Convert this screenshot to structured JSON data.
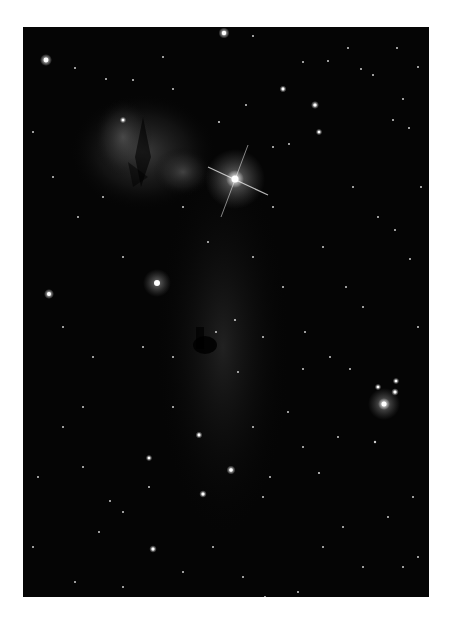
{
  "image": {
    "subject": "Horsehead and Flame Nebula star field",
    "style": "grayscale astrophotograph",
    "frame": {
      "left": 23,
      "top": 27,
      "width": 406,
      "height": 570
    },
    "background_color": "#050505",
    "page_background": "#ffffff"
  },
  "features": {
    "flame_nebula": {
      "cx": 125,
      "cy": 120,
      "r": 70
    },
    "bright_star_alnitak": {
      "cx": 212,
      "cy": 152
    },
    "horsehead_dark_nebula": {
      "cx": 185,
      "cy": 320
    },
    "nebula_star": {
      "cx": 134,
      "cy": 256
    },
    "bright_star_lower_right": {
      "cx": 361,
      "cy": 377
    }
  },
  "stars": [
    [
      23,
      33,
      2.4
    ],
    [
      201,
      6,
      2.2
    ],
    [
      52,
      41,
      1
    ],
    [
      83,
      52,
      1
    ],
    [
      110,
      53,
      1
    ],
    [
      230,
      9,
      1
    ],
    [
      280,
      35,
      1
    ],
    [
      305,
      34,
      1
    ],
    [
      325,
      21,
      1
    ],
    [
      350,
      48,
      1
    ],
    [
      374,
      21,
      1
    ],
    [
      395,
      40,
      1
    ],
    [
      150,
      62,
      1
    ],
    [
      260,
      62,
      1.4
    ],
    [
      292,
      78,
      1.6
    ],
    [
      296,
      105,
      1.3
    ],
    [
      223,
      78,
      1
    ],
    [
      338,
      42,
      1
    ],
    [
      380,
      72,
      1
    ],
    [
      10,
      105,
      1
    ],
    [
      100,
      93,
      1.3
    ],
    [
      196,
      95,
      1.1
    ],
    [
      370,
      93,
      1
    ],
    [
      386,
      101,
      1
    ],
    [
      266,
      117,
      1
    ],
    [
      330,
      160,
      1
    ],
    [
      398,
      160,
      1
    ],
    [
      250,
      180,
      1
    ],
    [
      355,
      190,
      1
    ],
    [
      372,
      203,
      1
    ],
    [
      387,
      232,
      1
    ],
    [
      300,
      220,
      1
    ],
    [
      323,
      260,
      1
    ],
    [
      340,
      280,
      1
    ],
    [
      282,
      305,
      1
    ],
    [
      307,
      330,
      1
    ],
    [
      327,
      342,
      1
    ],
    [
      355,
      360,
      1.3
    ],
    [
      372,
      365,
      1.5
    ],
    [
      373,
      354,
      1.3
    ],
    [
      352,
      415,
      1.2
    ],
    [
      315,
      410,
      1
    ],
    [
      296,
      446,
      1.1
    ],
    [
      26,
      267,
      2
    ],
    [
      193,
      305,
      1
    ],
    [
      212,
      293,
      1.1
    ],
    [
      280,
      342,
      1
    ],
    [
      247,
      450,
      1
    ],
    [
      240,
      470,
      1
    ],
    [
      176,
      408,
      1.4
    ],
    [
      208,
      443,
      1.8
    ],
    [
      180,
      467,
      1.5
    ],
    [
      126,
      460,
      1
    ],
    [
      126,
      431,
      1.3
    ],
    [
      87,
      474,
      1
    ],
    [
      100,
      485,
      1
    ],
    [
      76,
      505,
      1
    ],
    [
      130,
      522,
      1.5
    ],
    [
      52,
      555,
      1
    ],
    [
      220,
      550,
      1
    ],
    [
      242,
      570,
      1
    ],
    [
      275,
      565,
      1
    ],
    [
      300,
      520,
      1
    ],
    [
      320,
      500,
      1
    ],
    [
      340,
      540,
      1
    ],
    [
      380,
      540,
      1
    ],
    [
      395,
      530,
      1
    ],
    [
      10,
      520,
      1
    ],
    [
      15,
      450,
      1
    ],
    [
      40,
      400,
      1
    ],
    [
      60,
      380,
      1
    ],
    [
      230,
      230,
      1
    ],
    [
      185,
      215,
      1
    ],
    [
      160,
      180,
      1
    ],
    [
      150,
      330,
      1
    ],
    [
      120,
      320,
      1
    ],
    [
      70,
      330,
      1
    ],
    [
      40,
      300,
      1
    ],
    [
      55,
      190,
      1
    ],
    [
      30,
      150,
      1
    ],
    [
      80,
      170,
      1
    ],
    [
      100,
      230,
      1
    ],
    [
      260,
      260,
      1
    ],
    [
      240,
      310,
      1
    ],
    [
      265,
      385,
      1
    ],
    [
      230,
      400,
      1
    ],
    [
      150,
      380,
      1
    ],
    [
      60,
      440,
      1
    ],
    [
      100,
      560,
      1
    ],
    [
      160,
      545,
      1
    ],
    [
      190,
      520,
      1
    ],
    [
      390,
      470,
      1
    ],
    [
      365,
      490,
      1
    ],
    [
      395,
      300,
      1
    ],
    [
      280,
      420,
      1
    ],
    [
      215,
      345,
      1
    ],
    [
      250,
      120,
      1
    ],
    [
      140,
      30,
      1
    ]
  ]
}
